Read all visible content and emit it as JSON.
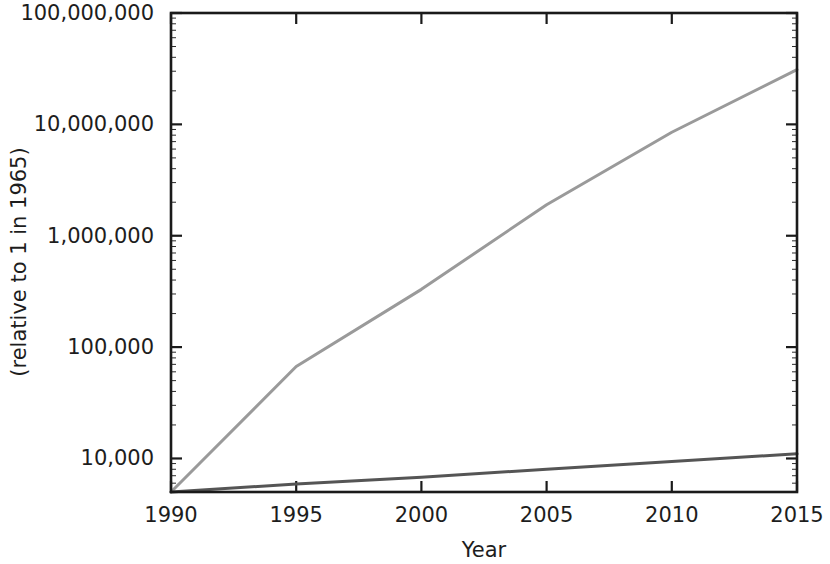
{
  "chart_data": {
    "type": "line",
    "title": "",
    "subtitle": "",
    "xlabel": "Year",
    "ylabel": "(relative to 1 in 1965)",
    "yscale": "log",
    "xscale": "linear",
    "xlim": [
      1990,
      2015
    ],
    "ylim": [
      5000,
      100000000
    ],
    "grid": false,
    "legend": null,
    "legend_position": "none",
    "x_ticks": [
      1990,
      1995,
      2000,
      2005,
      2010,
      2015
    ],
    "x_tick_labels": [
      "1990",
      "1995",
      "2000",
      "2005",
      "2010",
      "2015"
    ],
    "y_ticks": [
      10000,
      100000,
      1000000,
      10000000,
      100000000
    ],
    "y_tick_labels": [
      "10,000",
      "100,000",
      "1,000,000",
      "10,000,000",
      "100,000,000"
    ],
    "y_minor_ticks": true,
    "x": [
      1990,
      1995,
      2000,
      2005,
      2010,
      2015
    ],
    "series": [
      {
        "name": "fast-growth-line",
        "color": "#9a9a9a",
        "width": 3,
        "values": [
          5000,
          67000,
          330000,
          1900000,
          8500000,
          31000000
        ]
      },
      {
        "name": "slow-growth-line",
        "color": "#555555",
        "width": 3,
        "values": [
          5000,
          5900,
          6800,
          8000,
          9400,
          11000
        ]
      }
    ],
    "annotations": []
  },
  "axes": {
    "frame_color": "#1a1a1a",
    "background": "#ffffff"
  }
}
